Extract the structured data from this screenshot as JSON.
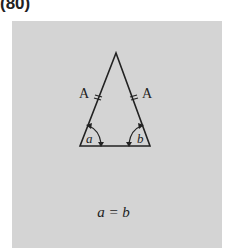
{
  "figure_number": "(80)",
  "diagram": {
    "type": "isosceles-triangle",
    "side_labels": [
      "A",
      "A"
    ],
    "angle_labels": [
      "a",
      "b"
    ],
    "equation": "a = b"
  },
  "colors": {
    "panel": "#d4d4d4",
    "ink": "#222222"
  }
}
